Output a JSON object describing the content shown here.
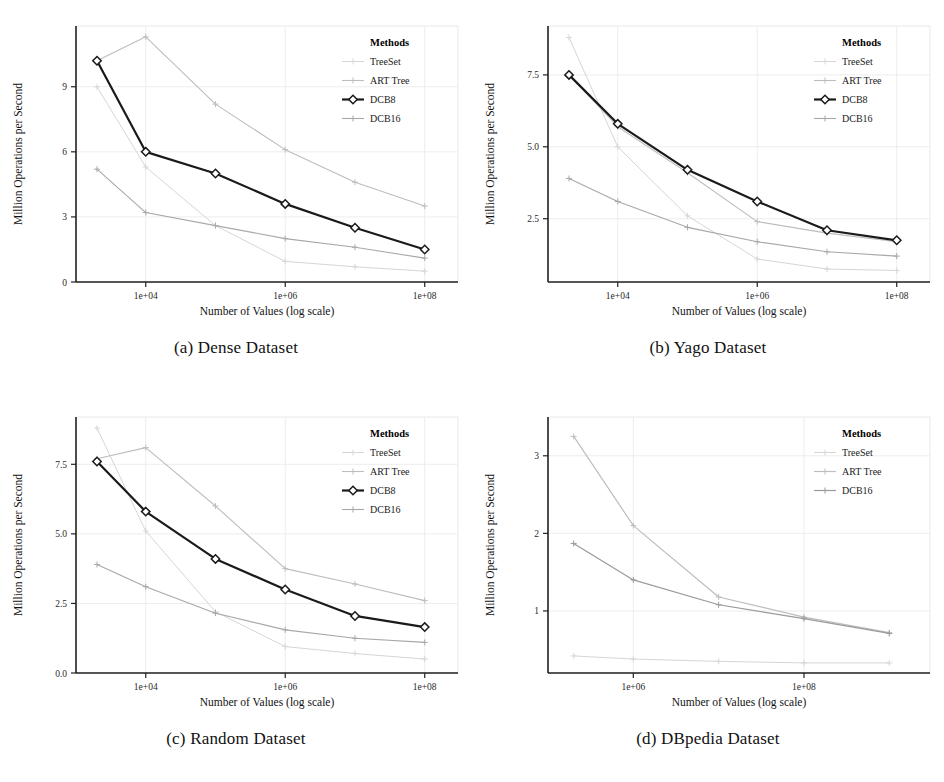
{
  "figure": {
    "panels": [
      {
        "id": "panel-a",
        "caption": "(a) Dense Dataset",
        "chart_data": {
          "type": "line",
          "title": "",
          "xlabel": "Number of Values (log scale)",
          "ylabel": "Million Operations per Second",
          "xscale": "log",
          "xlim": [
            1000,
            300000000
          ],
          "ylim": [
            0,
            11.8
          ],
          "xticks": [
            10000,
            1000000,
            100000000
          ],
          "xticklabels": [
            "1e+04",
            "1e+06",
            "1e+08"
          ],
          "yticks": [
            0,
            3,
            6,
            9
          ],
          "yticklabels": [
            "0",
            "3",
            "6",
            "9"
          ],
          "grid": true,
          "legend_title": "Methods",
          "legend_position": "top-right",
          "x": [
            2000,
            10000,
            100000,
            1000000,
            10000000,
            100000000
          ],
          "series": [
            {
              "name": "TreeSet",
              "color": "#d6d6d6",
              "marker": "plus",
              "linewidth": 1,
              "values": [
                9.0,
                5.3,
                2.6,
                0.95,
                0.7,
                0.5
              ]
            },
            {
              "name": "ART Tree",
              "color": "#bdbdbd",
              "marker": "plus",
              "linewidth": 1.1,
              "values": [
                10.2,
                11.3,
                8.2,
                6.1,
                4.6,
                3.5
              ]
            },
            {
              "name": "DCB8",
              "color": "#1a1a1a",
              "marker": "diamond",
              "linewidth": 2.2,
              "values": [
                10.2,
                6.0,
                5.0,
                3.6,
                2.5,
                1.5
              ]
            },
            {
              "name": "DCB16",
              "color": "#a8a8a8",
              "marker": "plus",
              "linewidth": 1.1,
              "values": [
                5.2,
                3.2,
                2.6,
                2.0,
                1.6,
                1.1
              ]
            }
          ]
        }
      },
      {
        "id": "panel-b",
        "caption": "(b) Yago Dataset",
        "chart_data": {
          "type": "line",
          "title": "",
          "xlabel": "Number of Values (log scale)",
          "ylabel": "Million Operations per Second",
          "xscale": "log",
          "xlim": [
            1000,
            300000000
          ],
          "ylim": [
            0.3,
            9.2
          ],
          "xticks": [
            10000,
            1000000,
            100000000
          ],
          "xticklabels": [
            "1e+04",
            "1e+06",
            "1e+08"
          ],
          "yticks": [
            2.5,
            5.0,
            7.5
          ],
          "yticklabels": [
            "2.5",
            "5.0",
            "7.5"
          ],
          "grid": true,
          "legend_title": "Methods",
          "legend_position": "top-right",
          "x": [
            2000,
            10000,
            100000,
            1000000,
            10000000,
            100000000
          ],
          "series": [
            {
              "name": "TreeSet",
              "color": "#d6d6d6",
              "marker": "plus",
              "linewidth": 1,
              "values": [
                8.8,
                5.0,
                2.6,
                1.1,
                0.75,
                0.7
              ]
            },
            {
              "name": "ART Tree",
              "color": "#bdbdbd",
              "marker": "plus",
              "linewidth": 1.1,
              "values": [
                7.5,
                5.7,
                4.1,
                2.4,
                2.0,
                1.7
              ]
            },
            {
              "name": "DCB8",
              "color": "#1a1a1a",
              "marker": "diamond",
              "linewidth": 2.2,
              "values": [
                7.5,
                5.8,
                4.2,
                3.1,
                2.1,
                1.75
              ]
            },
            {
              "name": "DCB16",
              "color": "#a8a8a8",
              "marker": "plus",
              "linewidth": 1.1,
              "values": [
                3.9,
                3.1,
                2.2,
                1.7,
                1.35,
                1.2
              ]
            }
          ]
        }
      },
      {
        "id": "panel-c",
        "caption": "(c) Random Dataset",
        "chart_data": {
          "type": "line",
          "title": "",
          "xlabel": "Number of Values (log scale)",
          "ylabel": "Million Operations per Second",
          "xscale": "log",
          "xlim": [
            1000,
            300000000
          ],
          "ylim": [
            0,
            9.2
          ],
          "xticks": [
            10000,
            1000000,
            100000000
          ],
          "xticklabels": [
            "1e+04",
            "1e+06",
            "1e+08"
          ],
          "yticks": [
            0.0,
            2.5,
            5.0,
            7.5
          ],
          "yticklabels": [
            "0.0",
            "2.5",
            "5.0",
            "7.5"
          ],
          "grid": true,
          "legend_title": "Methods",
          "legend_position": "top-right",
          "x": [
            2000,
            10000,
            100000,
            1000000,
            10000000,
            100000000
          ],
          "series": [
            {
              "name": "TreeSet",
              "color": "#d6d6d6",
              "marker": "plus",
              "linewidth": 1,
              "values": [
                8.8,
                5.1,
                2.2,
                0.95,
                0.7,
                0.5
              ]
            },
            {
              "name": "ART Tree",
              "color": "#bdbdbd",
              "marker": "plus",
              "linewidth": 1.1,
              "values": [
                7.7,
                8.1,
                6.0,
                3.75,
                3.2,
                2.6
              ]
            },
            {
              "name": "DCB8",
              "color": "#1a1a1a",
              "marker": "diamond",
              "linewidth": 2.2,
              "values": [
                7.6,
                5.8,
                4.1,
                3.0,
                2.05,
                1.65
              ]
            },
            {
              "name": "DCB16",
              "color": "#a8a8a8",
              "marker": "plus",
              "linewidth": 1.1,
              "values": [
                3.9,
                3.1,
                2.15,
                1.55,
                1.25,
                1.1
              ]
            }
          ]
        }
      },
      {
        "id": "panel-d",
        "caption": "(d) DBpedia Dataset",
        "chart_data": {
          "type": "line",
          "title": "",
          "xlabel": "Number of Values (log scale)",
          "ylabel": "Million Operations per Second",
          "xscale": "log",
          "xlim": [
            100000,
            3000000000
          ],
          "ylim": [
            0.2,
            3.5
          ],
          "xticks": [
            1000000,
            100000000
          ],
          "xticklabels": [
            "1e+06",
            "1e+08"
          ],
          "yticks": [
            1,
            2,
            3
          ],
          "yticklabels": [
            "1",
            "2",
            "3"
          ],
          "grid": true,
          "legend_title": "Methods",
          "legend_position": "top-right",
          "x": [
            200000,
            1000000,
            10000000,
            100000000,
            1000000000
          ],
          "series": [
            {
              "name": "TreeSet",
              "color": "#d6d6d6",
              "marker": "plus",
              "linewidth": 1,
              "values": [
                0.42,
                0.38,
                0.35,
                0.33,
                0.33
              ]
            },
            {
              "name": "ART Tree",
              "color": "#bdbdbd",
              "marker": "plus",
              "linewidth": 1.2,
              "values": [
                3.25,
                2.1,
                1.18,
                0.92,
                0.72
              ]
            },
            {
              "name": "DCB16",
              "color": "#9a9a9a",
              "marker": "plus",
              "linewidth": 1.2,
              "values": [
                1.87,
                1.4,
                1.08,
                0.9,
                0.71
              ]
            }
          ]
        }
      }
    ]
  }
}
